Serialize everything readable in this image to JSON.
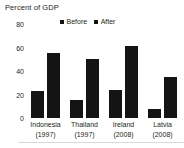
{
  "chart_data": {
    "type": "bar",
    "title": "Percent of GDP",
    "xlabel": "",
    "ylabel": "",
    "ylim": [
      0,
      80
    ],
    "yticks": [
      0,
      20,
      40,
      60,
      80
    ],
    "grid": false,
    "legend_position": "top-center",
    "categories": [
      "Indonesia",
      "Thailand",
      "Ireland",
      "Latvia"
    ],
    "category_years": [
      "(1997)",
      "(1997)",
      "(2008)",
      "(2008)"
    ],
    "series": [
      {
        "name": "Before",
        "color": "#141414",
        "values": [
          23,
          15,
          24,
          8
        ]
      },
      {
        "name": "After",
        "color": "#141414",
        "values": [
          55,
          50,
          61,
          35
        ]
      }
    ]
  },
  "legend": {
    "items": [
      {
        "label": "Before"
      },
      {
        "label": "After"
      }
    ]
  },
  "axis": {
    "y": {
      "t80": "80",
      "t60": "60",
      "t40": "40",
      "t20": "20",
      "t0": "0"
    }
  },
  "categories": [
    {
      "name": "Indonesia",
      "year": "(1997)"
    },
    {
      "name": "Thailand",
      "year": "(1997)"
    },
    {
      "name": "Ireland",
      "year": "(2008)"
    },
    {
      "name": "Latvia",
      "year": "(2008)"
    }
  ]
}
